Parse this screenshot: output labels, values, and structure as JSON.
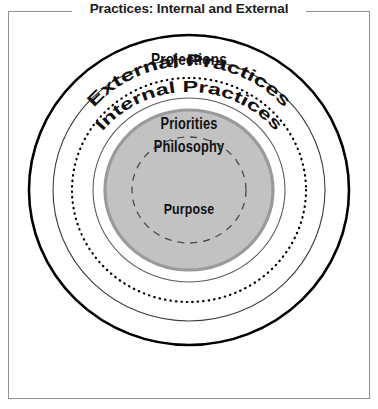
{
  "figure": {
    "title": "Practices: Internal and External"
  },
  "diagram": {
    "type": "concentric-circles",
    "rings": [
      {
        "label": "Projections",
        "order": 1,
        "stroke_style": "solid-thick",
        "stroke_color": "#000000",
        "fill": "#ffffff"
      },
      {
        "label": "External Practices",
        "order": 2,
        "stroke_style": "solid-thin",
        "stroke_color": "#333333",
        "fill": "#ffffff",
        "text_path": "curved"
      },
      {
        "label": "Internal Practices",
        "order": 3,
        "stroke_style": "dotted",
        "stroke_color": "#000000",
        "fill": "#ffffff",
        "text_path": "curved"
      },
      {
        "label": "Priorities",
        "order": 4,
        "stroke_style": "solid-thin",
        "stroke_color": "#555555",
        "fill": "#ffffff"
      },
      {
        "label": "Philosophy",
        "order": 5,
        "stroke_style": "solid-thick-gray",
        "stroke_color": "#9a9a9a",
        "fill": "#c2c2c2"
      },
      {
        "label": "Purpose",
        "order": 6,
        "stroke_style": "dashed",
        "stroke_color": "#4a4a4a",
        "fill": "#c2c2c2"
      }
    ]
  },
  "colors": {
    "frame_border": "#8f9194",
    "ring_black": "#000000",
    "ring_gray": "#9a9a9a",
    "core_fill": "#c2c2c2",
    "text": "#111111",
    "background": "#ffffff"
  }
}
